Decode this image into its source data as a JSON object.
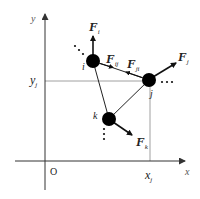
{
  "diagram": {
    "axes": {
      "x_label": "x",
      "y_label": "y",
      "origin_label": "O",
      "x_marker_label": "x",
      "x_marker_sub": "j",
      "y_marker_label": "y",
      "y_marker_sub": "j"
    },
    "nodes": [
      {
        "id": "i",
        "label": "i"
      },
      {
        "id": "j",
        "label": "j"
      },
      {
        "id": "k",
        "label": "k"
      }
    ],
    "forces": [
      {
        "id": "F_i",
        "label": "F",
        "sub": "i"
      },
      {
        "id": "F_j",
        "label": "F",
        "sub": "j"
      },
      {
        "id": "F_k",
        "label": "F",
        "sub": "k"
      },
      {
        "id": "F_ij",
        "label": "F",
        "sub": "ij"
      },
      {
        "id": "F_ji",
        "label": "F",
        "sub": "ji"
      }
    ],
    "ellipsis": "···",
    "colors": {
      "line": "#222222",
      "axis": "#333333",
      "guide": "#888888",
      "node": "#000000"
    }
  }
}
